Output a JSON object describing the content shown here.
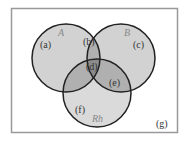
{
  "diagram": {
    "type": "venn-3",
    "sets": [
      {
        "name": "A",
        "label": "A"
      },
      {
        "name": "B",
        "label": "B"
      },
      {
        "name": "Rh",
        "label": "Rh"
      }
    ],
    "regions": {
      "a": "(a)",
      "b": "(b)",
      "c": "(c)",
      "d": "(d)",
      "e": "(e)",
      "f": "(f)",
      "g": "(g)"
    },
    "colors": {
      "frame": "#999999",
      "outline": "#222222",
      "single": "#cfcfcf",
      "double": "#a9a9a9",
      "triple": "#8a8a8a",
      "background": "#ffffff"
    }
  }
}
